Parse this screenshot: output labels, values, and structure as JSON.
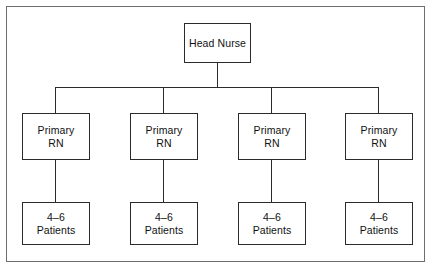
{
  "diagram": {
    "type": "organization-chart",
    "title": "",
    "orientation": "top-down",
    "levels": 3,
    "colors": {
      "background": "#ffffff",
      "frame_stroke": "#6e6e6e",
      "box_stroke": "#2b2b2b",
      "connector_stroke": "#2b2b2b",
      "text": "#111111"
    },
    "root": {
      "label": "Head Nurse",
      "lines": [
        "Head Nurse"
      ]
    },
    "branches": [
      {
        "role": {
          "lines": [
            "Primary",
            "RN"
          ],
          "label": "Primary RN"
        },
        "assignment": {
          "lines": [
            "4–6",
            "Patients"
          ],
          "label": "4–6 Patients"
        }
      },
      {
        "role": {
          "lines": [
            "Primary",
            "RN"
          ],
          "label": "Primary RN"
        },
        "assignment": {
          "lines": [
            "4–6",
            "Patients"
          ],
          "label": "4–6 Patients"
        }
      },
      {
        "role": {
          "lines": [
            "Primary",
            "RN"
          ],
          "label": "Primary RN"
        },
        "assignment": {
          "lines": [
            "4–6",
            "Patients"
          ],
          "label": "4–6 Patients"
        }
      },
      {
        "role": {
          "lines": [
            "Primary",
            "RN"
          ],
          "label": "Primary RN"
        },
        "assignment": {
          "lines": [
            "4–6",
            "Patients"
          ],
          "label": "4–6 Patients"
        }
      }
    ]
  }
}
